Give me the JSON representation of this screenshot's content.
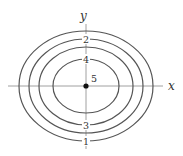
{
  "diagram": {
    "type": "contour-plot",
    "axes": {
      "x_label": "x",
      "y_label": "y",
      "origin": [
        86,
        86
      ],
      "x_range_px": [
        8,
        163
      ],
      "y_range_px": [
        12,
        149
      ]
    },
    "center_point": {
      "x": 86,
      "y": 86,
      "label": "5"
    },
    "contours": [
      {
        "level": "1",
        "rx": 67,
        "ry": 55,
        "label_position": "bottom"
      },
      {
        "level": "2",
        "rx": 57,
        "ry": 47,
        "label_position": "top"
      },
      {
        "level": "3",
        "rx": 47,
        "ry": 39,
        "label_position": "bottom"
      },
      {
        "level": "4",
        "rx": 33,
        "ry": 27,
        "label_position": "top"
      }
    ],
    "colors": {
      "stroke": "#555555",
      "axis": "#888888",
      "point": "#111111",
      "text": "#333333"
    }
  }
}
